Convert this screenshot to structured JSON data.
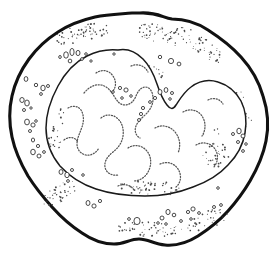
{
  "figure": {
    "kind": "line-drawing",
    "subject_label": "cell",
    "caption": "",
    "background_color": "#ffffff",
    "ink_color": "#111111",
    "stipple_color": "#4a4a4a",
    "chromatin_color": "#555555",
    "granule_outline_color": "#2b2b2b",
    "canvas": {
      "width": 274,
      "height": 273
    },
    "structures": [
      {
        "name": "cell-membrane",
        "style": "thick-irregular-outline",
        "stroke_width": 3.1
      },
      {
        "name": "cytoplasm",
        "style": "white-fill-with-stipple"
      },
      {
        "name": "nucleus",
        "style": "kidney-shaped-thin-outline",
        "stroke_width": 1.5
      },
      {
        "name": "chromatin",
        "style": "dotted-strands"
      },
      {
        "name": "granules",
        "style": "small-open-circles"
      }
    ]
  },
  "geometry": {
    "membrane_d": "M 140 13 C 158 12 163 18 172 19 C 186 19 196 22 208 30 C 222 39 232 47 241 57 C 252 69 259 82 263 96 C 268 111 269 126 266 141 C 263 156 257 169 250 181 C 243 193 236 202 228 211 C 219 221 209 229 198 236 C 187 243 176 246 165 245 C 154 244 148 239 139 239 C 130 239 124 244 114 244 C 103 244 92 240 82 233 C 71 226 61 217 52 207 C 43 197 35 187 28 176 C 21 164 15 151 12 137 C 9 123 9 109 12 96 C 15 82 21 70 29 59 C 37 48 47 39 58 32 C 70 24 82 20 95 17 C 108 14 121 14 132 13 C 136 13 138 13 140 13 Z",
    "nucleus_d": "M 118 50 C 128 48 136 52 143 59 C 150 66 154 75 157 84 C 160 93 163 100 167 105 C 170 109 173 110 176 105 C 180 99 184 92 191 87 C 199 81 209 79 218 82 C 228 85 236 92 241 101 C 246 111 247 122 245 133 C 243 145 237 156 228 165 C 219 175 207 182 193 187 C 178 193 162 196 145 196 C 128 196 111 194 96 189 C 81 184 69 176 60 166 C 51 155 46 142 46 128 C 46 113 51 99 58 86 C 65 73 75 62 87 56 C 97 51 108 49 118 50 Z",
    "chromatin_strands": [
      "M 84 93 C 89 87 95 84 101 85 C 107 86 111 91 114 96 C 117 101 120 105 125 105 C 130 105 134 101 136 96 C 138 91 141 87 146 87 C 151 88 153 93 153 99 C 153 105 150 110 146 114 C 142 118 138 121 136 126 C 134 131 136 136 140 138",
      "M 68 108 C 73 105 78 106 81 110 C 84 115 84 121 82 127 C 80 133 77 138 77 144 C 77 150 81 154 86 155 C 91 156 96 153 99 148",
      "M 101 118 C 106 114 112 114 117 118 C 122 122 124 129 123 136 C 122 143 118 148 113 152 C 108 156 104 161 105 167 C 106 173 112 176 118 175",
      "M 128 148 C 134 144 141 145 146 150 C 151 155 152 163 149 170 C 146 177 140 181 133 181",
      "M 155 128 C 162 124 170 126 175 132 C 180 138 181 146 178 153",
      "M 183 112 C 190 108 198 110 202 116 C 206 122 206 130 202 136",
      "M 196 145 C 203 141 211 143 215 149 C 219 155 218 163 213 168",
      "M 160 164 C 167 161 174 163 178 169 C 182 175 181 183 176 187",
      "M 96 73 C 102 69 109 70 113 76 C 117 82 116 89 111 93",
      "M 131 66 C 138 63 145 66 148 72",
      "M 208 100 C 214 97 220 99 223 104",
      "M 64 140 C 69 136 75 137 78 142",
      "M 118 186 C 124 183 131 185 134 190"
    ],
    "granules": [
      {
        "cx": 66,
        "cy": 55,
        "rx": 2.3,
        "ry": 3.2
      },
      {
        "cx": 72,
        "cy": 52,
        "rx": 2.1,
        "ry": 3.6
      },
      {
        "cx": 78,
        "cy": 53,
        "rx": 2.0,
        "ry": 2.6
      },
      {
        "cx": 70,
        "cy": 61,
        "rx": 1.8,
        "ry": 1.9
      },
      {
        "cx": 82,
        "cy": 59,
        "rx": 1.4,
        "ry": 1.4
      },
      {
        "cx": 86,
        "cy": 54,
        "rx": 1.3,
        "ry": 1.3
      },
      {
        "cx": 60,
        "cy": 57,
        "rx": 1.3,
        "ry": 1.5
      },
      {
        "cx": 91,
        "cy": 61,
        "rx": 1.2,
        "ry": 1.2
      },
      {
        "cx": 160,
        "cy": 57,
        "rx": 1.7,
        "ry": 1.7
      },
      {
        "cx": 171,
        "cy": 61,
        "rx": 2.6,
        "ry": 2.6
      },
      {
        "cx": 179,
        "cy": 64,
        "rx": 1.9,
        "ry": 1.9
      },
      {
        "cx": 26,
        "cy": 79,
        "rx": 1.9,
        "ry": 2.4
      },
      {
        "cx": 36,
        "cy": 85,
        "rx": 1.7,
        "ry": 1.7
      },
      {
        "cx": 43,
        "cy": 88,
        "rx": 2.2,
        "ry": 2.8
      },
      {
        "cx": 48,
        "cy": 86,
        "rx": 1.5,
        "ry": 1.5
      },
      {
        "cx": 41,
        "cy": 94,
        "rx": 1.4,
        "ry": 1.4
      },
      {
        "cx": 22,
        "cy": 100,
        "rx": 2.2,
        "ry": 2.5
      },
      {
        "cx": 27,
        "cy": 103,
        "rx": 2.3,
        "ry": 3.0
      },
      {
        "cx": 24,
        "cy": 110,
        "rx": 1.5,
        "ry": 1.5
      },
      {
        "cx": 31,
        "cy": 108,
        "rx": 1.2,
        "ry": 1.2
      },
      {
        "cx": 27,
        "cy": 122,
        "rx": 2.4,
        "ry": 2.9
      },
      {
        "cx": 33,
        "cy": 125,
        "rx": 2.1,
        "ry": 2.1
      },
      {
        "cx": 30,
        "cy": 131,
        "rx": 1.5,
        "ry": 1.5
      },
      {
        "cx": 36,
        "cy": 121,
        "rx": 1.3,
        "ry": 1.3
      },
      {
        "cx": 33,
        "cy": 140,
        "rx": 1.6,
        "ry": 2.0
      },
      {
        "cx": 38,
        "cy": 146,
        "rx": 1.6,
        "ry": 1.6
      },
      {
        "cx": 33,
        "cy": 152,
        "rx": 2.3,
        "ry": 2.8
      },
      {
        "cx": 39,
        "cy": 156,
        "rx": 2.0,
        "ry": 2.0
      },
      {
        "cx": 44,
        "cy": 152,
        "rx": 1.4,
        "ry": 1.4
      },
      {
        "cx": 61,
        "cy": 172,
        "rx": 2.0,
        "ry": 2.4
      },
      {
        "cx": 67,
        "cy": 175,
        "rx": 2.2,
        "ry": 2.7
      },
      {
        "cx": 72,
        "cy": 170,
        "rx": 1.5,
        "ry": 1.5
      },
      {
        "cx": 68,
        "cy": 181,
        "rx": 1.4,
        "ry": 1.4
      },
      {
        "cx": 88,
        "cy": 203,
        "rx": 2.0,
        "ry": 2.5
      },
      {
        "cx": 94,
        "cy": 206,
        "rx": 2.1,
        "ry": 2.1
      },
      {
        "cx": 100,
        "cy": 201,
        "rx": 1.6,
        "ry": 1.6
      },
      {
        "cx": 129,
        "cy": 219,
        "rx": 1.4,
        "ry": 1.4
      },
      {
        "cx": 137,
        "cy": 221,
        "rx": 3.1,
        "ry": 3.6
      },
      {
        "cx": 162,
        "cy": 218,
        "rx": 2.0,
        "ry": 2.0
      },
      {
        "cx": 168,
        "cy": 212,
        "rx": 2.1,
        "ry": 2.6
      },
      {
        "cx": 174,
        "cy": 215,
        "rx": 1.8,
        "ry": 1.8
      },
      {
        "cx": 158,
        "cy": 223,
        "rx": 1.3,
        "ry": 1.3
      },
      {
        "cx": 166,
        "cy": 224,
        "rx": 1.3,
        "ry": 1.3
      },
      {
        "cx": 181,
        "cy": 221,
        "rx": 1.4,
        "ry": 1.4
      },
      {
        "cx": 188,
        "cy": 212,
        "rx": 1.6,
        "ry": 1.6
      },
      {
        "cx": 193,
        "cy": 209,
        "rx": 2.1,
        "ry": 2.1
      },
      {
        "cx": 199,
        "cy": 213,
        "rx": 1.4,
        "ry": 1.4
      },
      {
        "cx": 191,
        "cy": 219,
        "rx": 1.3,
        "ry": 1.3
      },
      {
        "cx": 214,
        "cy": 207,
        "rx": 1.5,
        "ry": 1.5
      },
      {
        "cx": 221,
        "cy": 205,
        "rx": 1.4,
        "ry": 1.4
      },
      {
        "cx": 233,
        "cy": 134,
        "rx": 1.5,
        "ry": 1.5
      },
      {
        "cx": 239,
        "cy": 131,
        "rx": 2.2,
        "ry": 2.8
      },
      {
        "cx": 243,
        "cy": 136,
        "rx": 2.0,
        "ry": 2.0
      },
      {
        "cx": 238,
        "cy": 142,
        "rx": 1.5,
        "ry": 1.5
      },
      {
        "cx": 246,
        "cy": 144,
        "rx": 1.3,
        "ry": 1.3
      },
      {
        "cx": 243,
        "cy": 151,
        "rx": 1.4,
        "ry": 1.4
      },
      {
        "cx": 120,
        "cy": 88,
        "rx": 1.6,
        "ry": 1.6
      },
      {
        "cx": 126,
        "cy": 90,
        "rx": 2.1,
        "ry": 2.1
      },
      {
        "cx": 113,
        "cy": 92,
        "rx": 1.3,
        "ry": 1.3
      },
      {
        "cx": 131,
        "cy": 96,
        "rx": 1.3,
        "ry": 1.3
      },
      {
        "cx": 122,
        "cy": 98,
        "rx": 1.3,
        "ry": 1.3
      },
      {
        "cx": 160,
        "cy": 92,
        "rx": 2.0,
        "ry": 2.5
      },
      {
        "cx": 166,
        "cy": 90,
        "rx": 1.9,
        "ry": 2.4
      },
      {
        "cx": 172,
        "cy": 93,
        "rx": 1.5,
        "ry": 1.5
      },
      {
        "cx": 155,
        "cy": 98,
        "rx": 1.6,
        "ry": 1.6
      },
      {
        "cx": 150,
        "cy": 102,
        "rx": 1.4,
        "ry": 1.4
      },
      {
        "cx": 170,
        "cy": 99,
        "rx": 1.3,
        "ry": 1.3
      },
      {
        "cx": 143,
        "cy": 108,
        "rx": 1.6,
        "ry": 1.6
      },
      {
        "cx": 141,
        "cy": 114,
        "rx": 1.6,
        "ry": 1.6
      },
      {
        "cx": 139,
        "cy": 120,
        "rx": 1.5,
        "ry": 1.5
      },
      {
        "cx": 218,
        "cy": 188,
        "rx": 1.3,
        "ry": 1.3
      },
      {
        "cx": 83,
        "cy": 175,
        "rx": 1.3,
        "ry": 1.3
      },
      {
        "cx": 114,
        "cy": 54,
        "rx": 1.2,
        "ry": 1.2
      }
    ],
    "stipple_fields": [
      {
        "name": "stipple-top-left",
        "cx": 82,
        "cy": 34,
        "rx": 30,
        "ry": 9,
        "count": 58,
        "rotate": -11
      },
      {
        "name": "stipple-top-right",
        "cx": 171,
        "cy": 35,
        "rx": 36,
        "ry": 10,
        "count": 68,
        "rotate": 9
      },
      {
        "name": "stipple-upper-right",
        "cx": 208,
        "cy": 53,
        "rx": 18,
        "ry": 10,
        "count": 30,
        "rotate": 35
      },
      {
        "name": "stipple-mid-upper",
        "cx": 136,
        "cy": 72,
        "rx": 28,
        "ry": 10,
        "count": 50,
        "rotate": 6
      },
      {
        "name": "stipple-notch",
        "cx": 148,
        "cy": 104,
        "rx": 14,
        "ry": 11,
        "count": 26,
        "rotate": 0
      },
      {
        "name": "stipple-nucleus-rim-left",
        "cx": 70,
        "cy": 96,
        "rx": 12,
        "ry": 18,
        "count": 30,
        "rotate": 25
      },
      {
        "name": "stipple-right-edge",
        "cx": 240,
        "cy": 110,
        "rx": 11,
        "ry": 20,
        "count": 26,
        "rotate": -15
      },
      {
        "name": "stipple-left-lower",
        "cx": 62,
        "cy": 192,
        "rx": 22,
        "ry": 9,
        "count": 40,
        "rotate": -30
      },
      {
        "name": "stipple-bottom",
        "cx": 150,
        "cy": 229,
        "rx": 34,
        "ry": 8,
        "count": 52,
        "rotate": 3
      },
      {
        "name": "stipple-bottom-right",
        "cx": 208,
        "cy": 220,
        "rx": 22,
        "ry": 9,
        "count": 34,
        "rotate": -22
      },
      {
        "name": "stipple-nuc-inner-right",
        "cx": 215,
        "cy": 150,
        "rx": 13,
        "ry": 24,
        "count": 34,
        "rotate": -10
      },
      {
        "name": "stipple-nuc-inner-bottom",
        "cx": 150,
        "cy": 188,
        "rx": 34,
        "ry": 7,
        "count": 42,
        "rotate": 2
      },
      {
        "name": "stipple-nuc-inner-left",
        "cx": 57,
        "cy": 130,
        "rx": 8,
        "ry": 22,
        "count": 26,
        "rotate": 8
      }
    ]
  }
}
